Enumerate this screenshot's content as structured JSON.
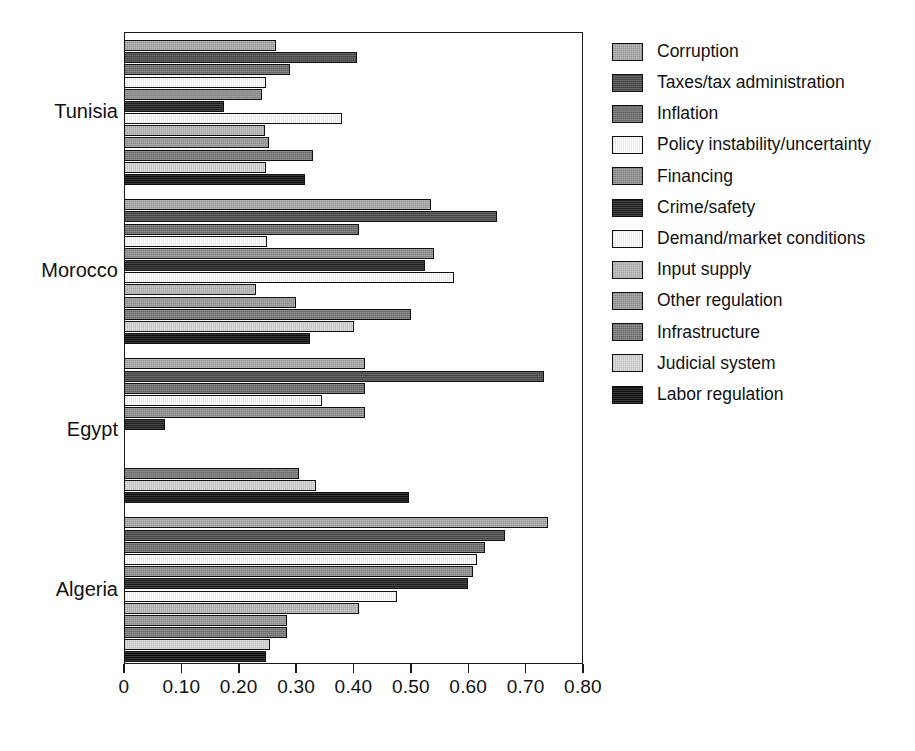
{
  "chart_data": {
    "type": "bar",
    "orientation": "horizontal",
    "title": "",
    "subtitle": "",
    "xlabel": "",
    "ylabel": "",
    "xlim": [
      0,
      0.8
    ],
    "grid": false,
    "legend_position": "right",
    "axis": {
      "tick_values": [
        0,
        0.1,
        0.2,
        0.3,
        0.4,
        0.5,
        0.6,
        0.7,
        0.8
      ],
      "tick_labels": [
        "0",
        "0.10",
        "0.20",
        "0.30",
        "0.40",
        "0.50",
        "0.60",
        "0.70",
        "0.80"
      ]
    },
    "categories": [
      "Tunisia",
      "Morocco",
      "Egypt",
      "Algeria"
    ],
    "series": [
      {
        "name": "Corruption",
        "color": "#a8a8a8",
        "values": [
          0.265,
          0.535,
          0.42,
          0.739
        ]
      },
      {
        "name": "Taxes/tax administration",
        "color": "#4a4a4a",
        "values": [
          0.406,
          0.65,
          0.732,
          0.664
        ]
      },
      {
        "name": "Inflation",
        "color": "#6e6e6e",
        "values": [
          0.289,
          0.41,
          0.42,
          0.63
        ]
      },
      {
        "name": "Policy instability/uncertainty",
        "color": "#ffffff",
        "values": [
          0.247,
          0.25,
          0.345,
          0.615
        ]
      },
      {
        "name": "Financing",
        "color": "#8e8e8e",
        "values": [
          0.24,
          0.54,
          0.42,
          0.608
        ]
      },
      {
        "name": "Crime/safety",
        "color": "#1f1f1f",
        "values": [
          0.175,
          0.525,
          0.072,
          0.6
        ]
      },
      {
        "name": "Demand/market conditions",
        "color": "#ffffff",
        "values": [
          0.38,
          0.575,
          0.0,
          0.475
        ]
      },
      {
        "name": "Input supply",
        "color": "#b9b9b9",
        "values": [
          0.245,
          0.23,
          0.0,
          0.41
        ]
      },
      {
        "name": "Other regulation",
        "color": "#9a9a9a",
        "values": [
          0.252,
          0.3,
          0.0,
          0.284
        ]
      },
      {
        "name": "Infrastructure",
        "color": "#777777",
        "values": [
          0.33,
          0.5,
          0.305,
          0.284
        ]
      },
      {
        "name": "Judicial system",
        "color": "#d6d6d6",
        "values": [
          0.248,
          0.4,
          0.335,
          0.254
        ]
      },
      {
        "name": "Labor regulation",
        "color": "#0d0d0d",
        "values": [
          0.315,
          0.325,
          0.497,
          0.247
        ]
      }
    ]
  },
  "legend": {
    "items": [
      {
        "label": "Corruption",
        "swatch": "corruption"
      },
      {
        "label": "Taxes/tax administration",
        "swatch": "taxes"
      },
      {
        "label": "Inflation",
        "swatch": "inflation"
      },
      {
        "label": "Policy instability/uncertainty",
        "swatch": "policy"
      },
      {
        "label": "Financing",
        "swatch": "financing"
      },
      {
        "label": "Crime/safety",
        "swatch": "crime"
      },
      {
        "label": "Demand/market conditions",
        "swatch": "demand"
      },
      {
        "label": "Input supply",
        "swatch": "input"
      },
      {
        "label": "Other regulation",
        "swatch": "otherreg"
      },
      {
        "label": "Infrastructure",
        "swatch": "infrastructure"
      },
      {
        "label": "Judicial system",
        "swatch": "judicial"
      },
      {
        "label": "Labor regulation",
        "swatch": "labor"
      }
    ]
  }
}
